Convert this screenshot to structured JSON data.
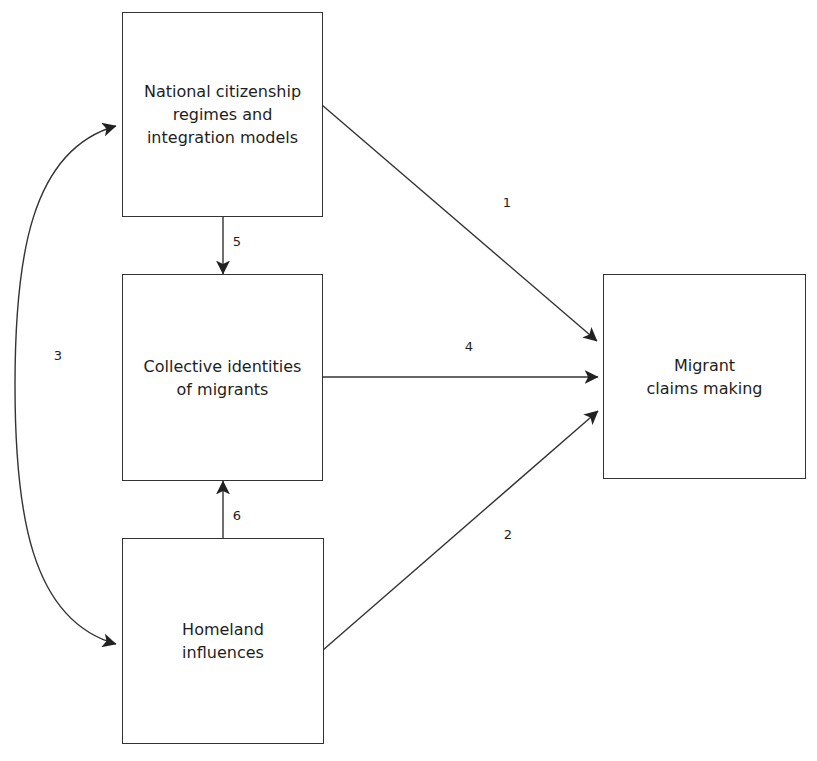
{
  "diagram": {
    "nodes": {
      "national": {
        "label": "National citizenship\nregimes and\nintegration models"
      },
      "collective": {
        "label": "Collective identities\nof migrants"
      },
      "homeland": {
        "label": "Homeland\ninfluences"
      },
      "claims": {
        "label": "Migrant\nclaims making"
      }
    },
    "edges": {
      "e1": {
        "label": "1",
        "from": "National citizenship regimes and integration models",
        "to": "Migrant claims making"
      },
      "e2": {
        "label": "2",
        "from": "Homeland influences",
        "to": "Migrant claims making"
      },
      "e3": {
        "label": "3",
        "from": "National citizenship regimes and integration models",
        "to": "Homeland influences",
        "bidirectional": true
      },
      "e4": {
        "label": "4",
        "from": "Collective identities of migrants",
        "to": "Migrant claims making"
      },
      "e5": {
        "label": "5",
        "from": "National citizenship regimes and integration models",
        "to": "Collective identities of migrants"
      },
      "e6": {
        "label": "6",
        "from": "Homeland influences",
        "to": "Collective identities of migrants"
      }
    },
    "colors": {
      "stroke": "#333333",
      "text": "#1e1e1e",
      "background": "#ffffff"
    }
  }
}
